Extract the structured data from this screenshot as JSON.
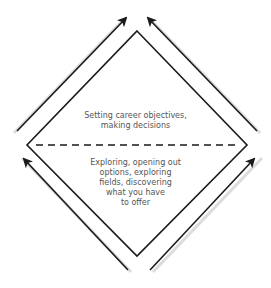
{
  "diagram": {
    "type": "diamond-funnel",
    "top_section": {
      "lines": [
        "Setting career objectives,",
        "making decisions"
      ]
    },
    "bottom_section": {
      "lines": [
        "Exploring, opening out",
        "options, exploring",
        "fields, discovering",
        "what you have",
        "to offer"
      ]
    },
    "colors": {
      "stroke": "#1a1a1a",
      "shadow": "#d8d8d8",
      "text": "#555555",
      "background": "#ffffff"
    },
    "arrows": [
      {
        "id": "top-left",
        "direction": "up-right"
      },
      {
        "id": "top-right",
        "direction": "up-left"
      },
      {
        "id": "bottom-left",
        "direction": "up-left"
      },
      {
        "id": "bottom-right",
        "direction": "up-right"
      }
    ]
  }
}
